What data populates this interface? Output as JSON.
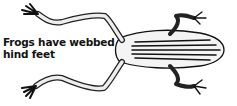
{
  "illustration": {
    "subject": "frog-top-view",
    "ink_color": "#111111",
    "background_color": "#ffffff"
  },
  "caption": {
    "line1": "Frogs have webbed",
    "line2": "hind feet"
  }
}
